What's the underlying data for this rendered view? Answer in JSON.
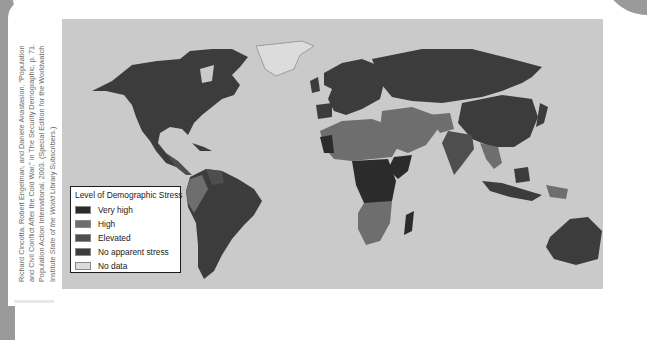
{
  "credit": {
    "lines": [
      "Richard Cincotta, Robert Engelman, and Daniele Anastasion, “Population",
      "and Civil Conflict After the Cold War,” in The Security Demographic, p. 71.",
      "Population Action International, 2003. (Special Edition for the Worldwatch"
    ],
    "line4_prefix": "Institute ",
    "line4_italic": "State of the World",
    "line4_suffix": " Library Subscribers.)"
  },
  "legend": {
    "title": "Level of Demographic Stress",
    "items": [
      {
        "label": "Very high",
        "color": "#2b2b2b"
      },
      {
        "label": "High",
        "color": "#6e6e6e"
      },
      {
        "label": "Elevated",
        "color": "#4e4e4e"
      },
      {
        "label": "No apparent stress",
        "color": "#3c3c3c"
      },
      {
        "label": "No data",
        "color": "#dcdcdc"
      }
    ]
  },
  "colors": {
    "ocean": "#cacaca",
    "very_high": "#2b2b2b",
    "high": "#6e6e6e",
    "elevated": "#4e4e4e",
    "no_stress": "#3c3c3c",
    "no_data": "#dcdcdc"
  }
}
